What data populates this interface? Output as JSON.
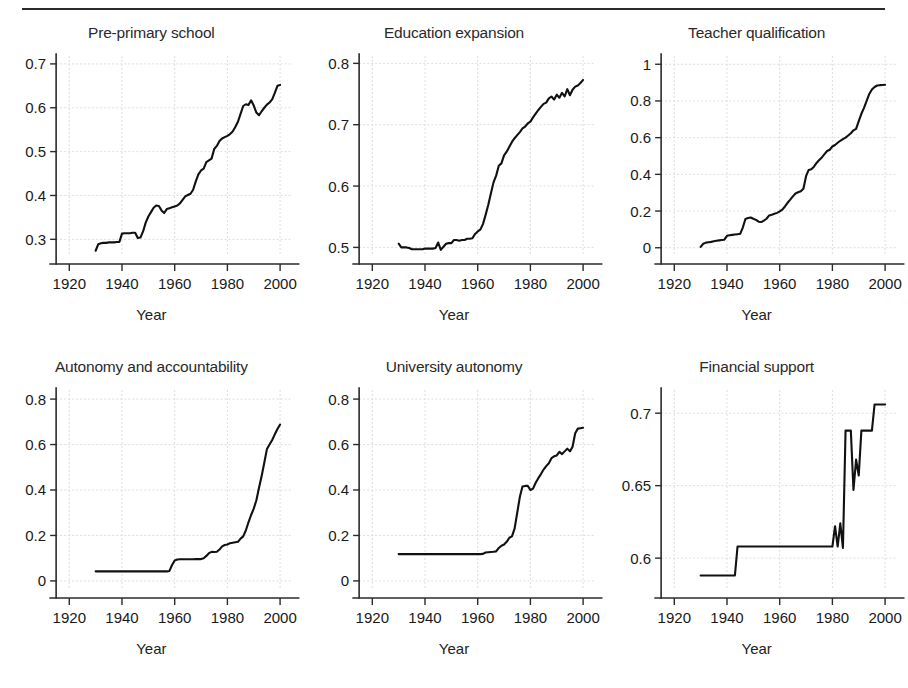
{
  "figure": {
    "xlabel": "Year",
    "rule": true
  },
  "chart_data": [
    {
      "type": "line",
      "title": "Pre-primary school",
      "xlabel": "Year",
      "ylabel": "",
      "xlim": [
        1915,
        2004
      ],
      "ylim": [
        0.262,
        0.718
      ],
      "xticks": [
        1920,
        1940,
        1960,
        1980,
        2000
      ],
      "yticks": [
        0.3,
        0.4,
        0.5,
        0.6,
        0.7
      ],
      "ytick_labels": [
        "0.3",
        "0.4",
        "0.5",
        "0.6",
        "0.7"
      ],
      "xtick_labels": [
        "1920",
        "1940",
        "1960",
        "1980",
        "2000"
      ],
      "grid": true,
      "legend": "none",
      "x": [
        1930,
        1931,
        1932,
        1933,
        1934,
        1935,
        1936,
        1937,
        1938,
        1939,
        1940,
        1941,
        1942,
        1943,
        1944,
        1945,
        1946,
        1947,
        1948,
        1949,
        1950,
        1951,
        1952,
        1953,
        1954,
        1955,
        1956,
        1957,
        1958,
        1959,
        1960,
        1961,
        1962,
        1963,
        1964,
        1965,
        1966,
        1967,
        1968,
        1969,
        1970,
        1971,
        1972,
        1973,
        1974,
        1975,
        1976,
        1977,
        1978,
        1979,
        1980,
        1981,
        1982,
        1983,
        1984,
        1985,
        1986,
        1987,
        1988,
        1989,
        1990,
        1991,
        1992,
        1993,
        1994,
        1995,
        1996,
        1997,
        1998,
        1999,
        2000
      ],
      "values": [
        0.274,
        0.289,
        0.291,
        0.292,
        0.292,
        0.293,
        0.293,
        0.293,
        0.294,
        0.294,
        0.313,
        0.314,
        0.314,
        0.314,
        0.315,
        0.315,
        0.303,
        0.304,
        0.318,
        0.338,
        0.352,
        0.362,
        0.372,
        0.377,
        0.376,
        0.366,
        0.36,
        0.369,
        0.371,
        0.373,
        0.375,
        0.377,
        0.382,
        0.39,
        0.398,
        0.401,
        0.404,
        0.413,
        0.432,
        0.448,
        0.457,
        0.461,
        0.476,
        0.48,
        0.484,
        0.506,
        0.513,
        0.524,
        0.53,
        0.533,
        0.536,
        0.54,
        0.546,
        0.556,
        0.568,
        0.586,
        0.604,
        0.608,
        0.606,
        0.617,
        0.605,
        0.589,
        0.583,
        0.592,
        0.6,
        0.607,
        0.612,
        0.619,
        0.634,
        0.65,
        0.652
      ]
    },
    {
      "type": "line",
      "title": "Education expansion",
      "xlabel": "Year",
      "ylabel": "",
      "xlim": [
        1915,
        2004
      ],
      "ylim": [
        0.486,
        0.812
      ],
      "xticks": [
        1920,
        1940,
        1960,
        1980,
        2000
      ],
      "yticks": [
        0.5,
        0.6,
        0.7,
        0.8
      ],
      "ytick_labels": [
        "0.5",
        "0.6",
        "0.7",
        "0.8"
      ],
      "xtick_labels": [
        "1920",
        "1940",
        "1960",
        "1980",
        "2000"
      ],
      "grid": true,
      "legend": "none",
      "x": [
        1930,
        1931,
        1932,
        1933,
        1934,
        1935,
        1936,
        1937,
        1938,
        1939,
        1940,
        1941,
        1942,
        1943,
        1944,
        1945,
        1946,
        1947,
        1948,
        1949,
        1950,
        1951,
        1952,
        1953,
        1954,
        1955,
        1956,
        1957,
        1958,
        1959,
        1960,
        1961,
        1962,
        1963,
        1964,
        1965,
        1966,
        1967,
        1968,
        1969,
        1970,
        1971,
        1972,
        1973,
        1974,
        1975,
        1976,
        1977,
        1978,
        1979,
        1980,
        1981,
        1982,
        1983,
        1984,
        1985,
        1986,
        1987,
        1988,
        1989,
        1990,
        1991,
        1992,
        1993,
        1994,
        1995,
        1996,
        1997,
        1998,
        1999,
        2000
      ],
      "values": [
        0.506,
        0.5,
        0.5,
        0.5,
        0.499,
        0.497,
        0.497,
        0.497,
        0.497,
        0.497,
        0.498,
        0.498,
        0.498,
        0.498,
        0.499,
        0.508,
        0.496,
        0.501,
        0.506,
        0.507,
        0.507,
        0.512,
        0.512,
        0.511,
        0.512,
        0.512,
        0.514,
        0.514,
        0.515,
        0.522,
        0.526,
        0.529,
        0.538,
        0.553,
        0.569,
        0.588,
        0.606,
        0.617,
        0.633,
        0.637,
        0.65,
        0.656,
        0.664,
        0.672,
        0.678,
        0.683,
        0.688,
        0.694,
        0.697,
        0.702,
        0.705,
        0.712,
        0.718,
        0.724,
        0.729,
        0.734,
        0.736,
        0.743,
        0.746,
        0.741,
        0.749,
        0.744,
        0.752,
        0.746,
        0.758,
        0.748,
        0.757,
        0.762,
        0.764,
        0.768,
        0.773
      ]
    },
    {
      "type": "line",
      "title": "Teacher qualification",
      "xlabel": "Year",
      "ylabel": "",
      "xlim": [
        1915,
        2004
      ],
      "ylim": [
        -0.045,
        1.045
      ],
      "xticks": [
        1920,
        1940,
        1960,
        1980,
        2000
      ],
      "yticks": [
        0,
        0.2,
        0.4,
        0.6,
        0.8,
        1
      ],
      "ytick_labels": [
        "0",
        "0.2",
        "0.4",
        "0.6",
        "0.8",
        "1"
      ],
      "xtick_labels": [
        "1920",
        "1940",
        "1960",
        "1980",
        "2000"
      ],
      "grid": true,
      "legend": "none",
      "x": [
        1930,
        1931,
        1932,
        1933,
        1934,
        1935,
        1936,
        1937,
        1938,
        1939,
        1940,
        1941,
        1942,
        1943,
        1944,
        1945,
        1946,
        1947,
        1948,
        1949,
        1950,
        1951,
        1952,
        1953,
        1954,
        1955,
        1956,
        1957,
        1958,
        1959,
        1960,
        1961,
        1962,
        1963,
        1964,
        1965,
        1966,
        1967,
        1968,
        1969,
        1970,
        1971,
        1972,
        1973,
        1974,
        1975,
        1976,
        1977,
        1978,
        1979,
        1980,
        1981,
        1982,
        1983,
        1984,
        1985,
        1986,
        1987,
        1988,
        1989,
        1990,
        1991,
        1992,
        1993,
        1994,
        1995,
        1996,
        1997,
        1998,
        1999,
        2000
      ],
      "values": [
        0.005,
        0.022,
        0.028,
        0.03,
        0.032,
        0.035,
        0.038,
        0.04,
        0.042,
        0.044,
        0.065,
        0.068,
        0.07,
        0.072,
        0.074,
        0.076,
        0.11,
        0.157,
        0.162,
        0.165,
        0.158,
        0.152,
        0.142,
        0.14,
        0.148,
        0.158,
        0.176,
        0.18,
        0.185,
        0.19,
        0.198,
        0.208,
        0.225,
        0.245,
        0.262,
        0.28,
        0.296,
        0.302,
        0.308,
        0.322,
        0.39,
        0.424,
        0.428,
        0.442,
        0.462,
        0.478,
        0.492,
        0.51,
        0.527,
        0.534,
        0.552,
        0.56,
        0.572,
        0.583,
        0.592,
        0.6,
        0.612,
        0.624,
        0.64,
        0.648,
        0.69,
        0.73,
        0.762,
        0.8,
        0.838,
        0.862,
        0.876,
        0.884,
        0.886,
        0.887,
        0.888
      ]
    },
    {
      "type": "line",
      "title": "Autonomy and accountability",
      "xlabel": "Year",
      "ylabel": "",
      "xlim": [
        1915,
        2004
      ],
      "ylim": [
        -0.04,
        0.84
      ],
      "xticks": [
        1920,
        1940,
        1960,
        1980,
        2000
      ],
      "yticks": [
        0,
        0.2,
        0.4,
        0.6,
        0.8
      ],
      "ytick_labels": [
        "0",
        "0.2",
        "0.4",
        "0.6",
        "0.8"
      ],
      "xtick_labels": [
        "1920",
        "1940",
        "1960",
        "1980",
        "2000"
      ],
      "grid": true,
      "legend": "none",
      "x": [
        1930,
        1931,
        1932,
        1933,
        1934,
        1935,
        1936,
        1937,
        1938,
        1939,
        1940,
        1941,
        1942,
        1943,
        1944,
        1945,
        1946,
        1947,
        1948,
        1949,
        1950,
        1951,
        1952,
        1953,
        1954,
        1955,
        1956,
        1957,
        1958,
        1959,
        1960,
        1961,
        1962,
        1963,
        1964,
        1965,
        1966,
        1967,
        1968,
        1969,
        1970,
        1971,
        1972,
        1973,
        1974,
        1975,
        1976,
        1977,
        1978,
        1979,
        1980,
        1981,
        1982,
        1983,
        1984,
        1985,
        1986,
        1987,
        1988,
        1989,
        1990,
        1991,
        1992,
        1993,
        1994,
        1995,
        1996,
        1997,
        1998,
        1999,
        2000
      ],
      "values": [
        0.042,
        0.042,
        0.042,
        0.042,
        0.042,
        0.042,
        0.042,
        0.042,
        0.042,
        0.042,
        0.042,
        0.042,
        0.042,
        0.042,
        0.042,
        0.042,
        0.042,
        0.042,
        0.042,
        0.042,
        0.042,
        0.042,
        0.042,
        0.042,
        0.042,
        0.042,
        0.042,
        0.042,
        0.044,
        0.07,
        0.09,
        0.094,
        0.095,
        0.095,
        0.095,
        0.095,
        0.095,
        0.095,
        0.096,
        0.096,
        0.096,
        0.1,
        0.11,
        0.122,
        0.128,
        0.127,
        0.128,
        0.138,
        0.152,
        0.158,
        0.16,
        0.166,
        0.168,
        0.17,
        0.172,
        0.186,
        0.196,
        0.222,
        0.258,
        0.29,
        0.318,
        0.355,
        0.41,
        0.462,
        0.52,
        0.58,
        0.6,
        0.62,
        0.645,
        0.668,
        0.688
      ]
    },
    {
      "type": "line",
      "title": "University autonomy",
      "xlabel": "Year",
      "ylabel": "",
      "xlim": [
        1915,
        2004
      ],
      "ylim": [
        -0.04,
        0.84
      ],
      "xticks": [
        1920,
        1940,
        1960,
        1980,
        2000
      ],
      "yticks": [
        0,
        0.2,
        0.4,
        0.6,
        0.8
      ],
      "ytick_labels": [
        "0",
        "0.2",
        "0.4",
        "0.6",
        "0.8"
      ],
      "xtick_labels": [
        "1920",
        "1940",
        "1960",
        "1980",
        "2000"
      ],
      "grid": true,
      "legend": "none",
      "x": [
        1930,
        1931,
        1932,
        1933,
        1934,
        1935,
        1936,
        1937,
        1938,
        1939,
        1940,
        1941,
        1942,
        1943,
        1944,
        1945,
        1946,
        1947,
        1948,
        1949,
        1950,
        1951,
        1952,
        1953,
        1954,
        1955,
        1956,
        1957,
        1958,
        1959,
        1960,
        1961,
        1962,
        1963,
        1964,
        1965,
        1966,
        1967,
        1968,
        1969,
        1970,
        1971,
        1972,
        1973,
        1974,
        1975,
        1976,
        1977,
        1978,
        1979,
        1980,
        1981,
        1982,
        1983,
        1984,
        1985,
        1986,
        1987,
        1988,
        1989,
        1990,
        1991,
        1992,
        1993,
        1994,
        1995,
        1996,
        1997,
        1998,
        1999,
        2000
      ],
      "values": [
        0.118,
        0.118,
        0.118,
        0.118,
        0.118,
        0.118,
        0.118,
        0.118,
        0.118,
        0.118,
        0.118,
        0.118,
        0.118,
        0.118,
        0.118,
        0.118,
        0.118,
        0.118,
        0.118,
        0.118,
        0.118,
        0.118,
        0.118,
        0.118,
        0.118,
        0.118,
        0.118,
        0.118,
        0.118,
        0.118,
        0.118,
        0.118,
        0.119,
        0.125,
        0.126,
        0.127,
        0.128,
        0.13,
        0.145,
        0.155,
        0.16,
        0.172,
        0.19,
        0.196,
        0.23,
        0.3,
        0.37,
        0.415,
        0.418,
        0.418,
        0.4,
        0.406,
        0.432,
        0.452,
        0.47,
        0.49,
        0.505,
        0.518,
        0.54,
        0.548,
        0.552,
        0.568,
        0.558,
        0.57,
        0.582,
        0.57,
        0.59,
        0.65,
        0.67,
        0.672,
        0.674
      ]
    },
    {
      "type": "line",
      "title": "Financial support",
      "xlabel": "Year",
      "ylabel": "",
      "xlim": [
        1915,
        2004
      ],
      "ylim": [
        0.578,
        0.716
      ],
      "xticks": [
        1920,
        1940,
        1960,
        1980,
        2000
      ],
      "yticks": [
        0.6,
        0.65,
        0.7
      ],
      "ytick_labels": [
        "0.6",
        "0.65",
        "0.7"
      ],
      "xtick_labels": [
        "1920",
        "1940",
        "1960",
        "1980",
        "2000"
      ],
      "grid": true,
      "legend": "none",
      "x": [
        1930,
        1931,
        1932,
        1933,
        1934,
        1935,
        1936,
        1937,
        1938,
        1939,
        1940,
        1941,
        1942,
        1943,
        1944,
        1945,
        1946,
        1947,
        1948,
        1949,
        1950,
        1951,
        1952,
        1953,
        1954,
        1955,
        1956,
        1957,
        1958,
        1959,
        1960,
        1961,
        1962,
        1963,
        1964,
        1965,
        1966,
        1967,
        1968,
        1969,
        1970,
        1971,
        1972,
        1973,
        1974,
        1975,
        1976,
        1977,
        1978,
        1979,
        1980,
        1981,
        1982,
        1983,
        1984,
        1985,
        1986,
        1987,
        1988,
        1989,
        1990,
        1991,
        1992,
        1993,
        1994,
        1995,
        1996,
        1997,
        1998,
        1999,
        2000
      ],
      "values": [
        0.588,
        0.588,
        0.588,
        0.588,
        0.588,
        0.588,
        0.588,
        0.588,
        0.588,
        0.588,
        0.588,
        0.588,
        0.588,
        0.588,
        0.608,
        0.608,
        0.608,
        0.608,
        0.608,
        0.608,
        0.608,
        0.608,
        0.608,
        0.608,
        0.608,
        0.608,
        0.608,
        0.608,
        0.608,
        0.608,
        0.608,
        0.608,
        0.608,
        0.608,
        0.608,
        0.608,
        0.608,
        0.608,
        0.608,
        0.608,
        0.608,
        0.608,
        0.608,
        0.608,
        0.608,
        0.608,
        0.608,
        0.608,
        0.608,
        0.608,
        0.608,
        0.622,
        0.608,
        0.624,
        0.607,
        0.688,
        0.688,
        0.688,
        0.647,
        0.668,
        0.657,
        0.688,
        0.688,
        0.688,
        0.688,
        0.688,
        0.706,
        0.706,
        0.706,
        0.706,
        0.706
      ]
    }
  ]
}
